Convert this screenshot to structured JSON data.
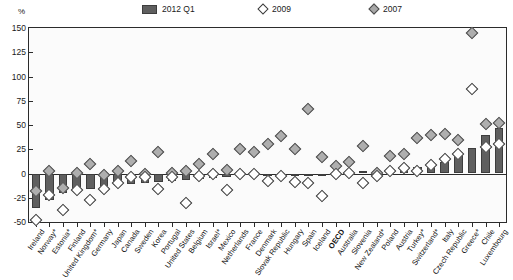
{
  "unit_label": "%",
  "legend": {
    "items": [
      {
        "label": "2012 Q1",
        "marker": "bar-swatch",
        "color": "#5f5f5f"
      },
      {
        "label": "2009",
        "marker": "open-diamond",
        "color": "#ffffff"
      },
      {
        "label": "2007",
        "marker": "filled-diamond",
        "color": "#a8a8a8"
      }
    ]
  },
  "chart_data": {
    "type": "bar",
    "title": "",
    "subtitle": "",
    "xlabel": "",
    "ylabel": "%",
    "ylim": [
      -50,
      150
    ],
    "yticks": [
      150,
      125,
      100,
      75,
      50,
      25,
      0,
      -25,
      -50
    ],
    "grid": false,
    "legend_position": "top-center",
    "categories": [
      "Ireland",
      "Norway*",
      "Estonia*",
      "Finland",
      "United Kingdom*",
      "Germany",
      "Japan",
      "Canada",
      "Sweden",
      "Korea",
      "Portugal",
      "United States",
      "Belgium",
      "Israel*",
      "Mexico",
      "Netherlands",
      "France",
      "Denmark",
      "Slovak Republic",
      "Hungary",
      "Spain",
      "Iceland",
      "OECD",
      "Australia",
      "Slovenia",
      "New Zealand*",
      "Poland",
      "Austria",
      "Turkey*",
      "Switzerland*",
      "Italy",
      "Czech Republic",
      "Greece*",
      "Chile",
      "Luxembourg"
    ],
    "highlight_category": "OECD",
    "series": [
      {
        "name": "2012 Q1",
        "type": "bar",
        "color": "#5f5f5f",
        "values": [
          -36,
          -27,
          -20,
          -18,
          -16,
          -13,
          -12,
          -11,
          -10,
          -9,
          -8,
          -7,
          -6,
          -5,
          -4,
          -3,
          -3,
          -2,
          -2,
          -1,
          -1,
          0,
          1,
          2,
          3,
          3,
          4,
          5,
          7,
          8,
          12,
          20,
          26,
          40,
          47
        ]
      },
      {
        "name": "2009",
        "type": "scatter",
        "marker": "open-diamond",
        "color": "#ffffff",
        "values": [
          -48,
          -22,
          -38,
          -17,
          -27,
          -16,
          -10,
          -4,
          -4,
          -16,
          -4,
          -30,
          -3,
          -1,
          -17,
          0,
          -1,
          -8,
          -3,
          -9,
          -10,
          -23,
          -1,
          1,
          -10,
          -3,
          3,
          6,
          3,
          9,
          15,
          20,
          87,
          27,
          30
        ]
      },
      {
        "name": "2007",
        "type": "scatter",
        "marker": "filled-diamond",
        "color": "#a8a8a8",
        "values": [
          -18,
          3,
          -15,
          1,
          10,
          -2,
          3,
          13,
          0,
          22,
          1,
          3,
          10,
          20,
          4,
          25,
          22,
          30,
          39,
          25,
          67,
          17,
          8,
          12,
          28,
          1,
          18,
          20,
          37,
          40,
          41,
          35,
          145,
          51,
          52
        ]
      }
    ]
  }
}
